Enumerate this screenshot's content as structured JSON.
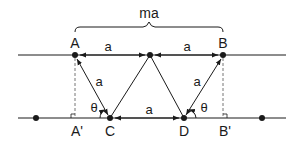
{
  "diagram": {
    "type": "geometry",
    "brace_label": "ma",
    "points": {
      "A": {
        "label": "A",
        "x": 75,
        "y": 55
      },
      "M": {
        "label": "",
        "x": 150,
        "y": 55
      },
      "B": {
        "label": "B",
        "x": 223,
        "y": 55
      },
      "C": {
        "label": "C",
        "x": 110,
        "y": 118
      },
      "D": {
        "label": "D",
        "x": 184,
        "y": 118
      },
      "A_prime": {
        "label": "A'",
        "x": 75,
        "y": 118
      },
      "B_prime": {
        "label": "B'",
        "x": 223,
        "y": 118
      },
      "left_dot": {
        "label": "",
        "x": 36,
        "y": 118
      },
      "right_dot": {
        "label": "",
        "x": 262,
        "y": 118
      }
    },
    "segment_labels": {
      "AM": "a",
      "MB": "a",
      "CA": "a",
      "DB": "a",
      "CD": "a"
    },
    "angle_labels": {
      "at_C": "θ",
      "at_D": "θ"
    },
    "colors": {
      "stroke": "#1a1a1a",
      "dashed": "#777777"
    }
  }
}
